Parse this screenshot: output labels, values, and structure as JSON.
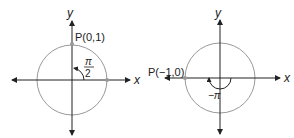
{
  "diagrams": [
    {
      "axis_x_label": "x",
      "axis_y_label": "y",
      "point_label": "P(0,1)",
      "angle_num": "π",
      "angle_den": "2"
    },
    {
      "axis_x_label": "x",
      "axis_y_label": "y",
      "point_label": "P(−1,0)",
      "angle_label": "−π"
    }
  ]
}
